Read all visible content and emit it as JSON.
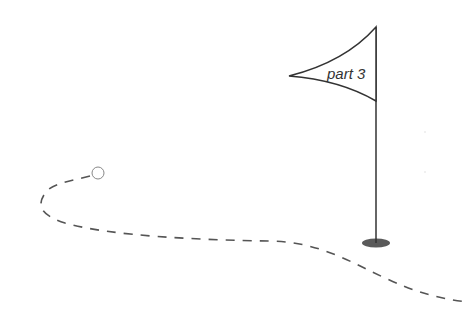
{
  "illustration": {
    "flag": {
      "label": "part 3"
    },
    "colors": {
      "background": "#ffffff",
      "line": "#333333",
      "path": "#555555",
      "ball_stroke": "#888888",
      "hole": "#5a5a5a"
    }
  }
}
